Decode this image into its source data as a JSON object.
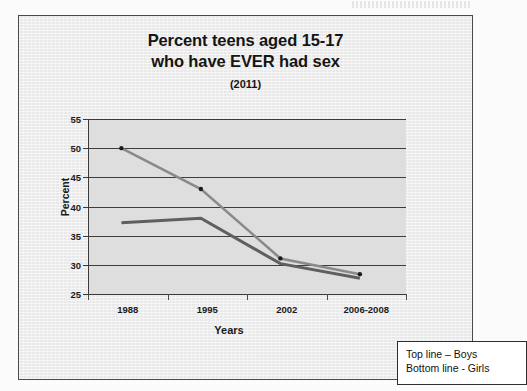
{
  "document": {
    "background_color": "#fbfbfb",
    "frame_color": "#e9e9e9",
    "frame_border_color": "#4a4a4a",
    "plot_background_color": "#dededf"
  },
  "title": {
    "line1": "Percent teens aged 15-17",
    "line2": "who have EVER had sex",
    "subtitle": "(2011)"
  },
  "axes": {
    "x_title": "Years",
    "y_title": "Percent"
  },
  "legend": {
    "top_line": "Top line – Boys",
    "bottom_line": "Bottom line - Girls"
  },
  "chart_data": {
    "type": "line",
    "title": "Percent teens aged 15-17 who have EVER had sex (2011)",
    "xlabel": "Years",
    "ylabel": "Percent",
    "categories": [
      "1988",
      "1995",
      "2002",
      "2006-2008"
    ],
    "ylim": [
      25,
      55
    ],
    "yticks": [
      25,
      30,
      35,
      40,
      45,
      50,
      55
    ],
    "grid": true,
    "legend_position": "outside-bottom-right-callout",
    "series": [
      {
        "name": "Boys",
        "legend_text": "Top line – Boys",
        "color": "#8a8a8a",
        "marker": "dot",
        "marker_color": "#1a1a1a",
        "values": [
          50.0,
          43.0,
          31.1,
          28.4
        ]
      },
      {
        "name": "Girls",
        "legend_text": "Bottom line - Girls",
        "color": "#5f5f5f",
        "marker": "none",
        "values": [
          37.2,
          38.0,
          30.2,
          27.7
        ]
      }
    ]
  }
}
